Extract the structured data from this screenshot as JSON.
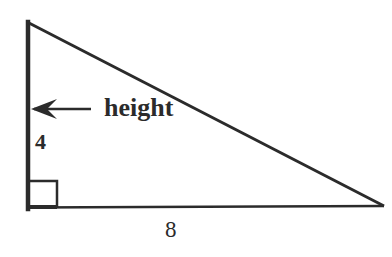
{
  "diagram": {
    "type": "right-triangle",
    "labels": {
      "height_label": "height",
      "height_value": "4",
      "base_value": "8"
    },
    "colors": {
      "stroke": "#2b2b2b",
      "background": "#ffffff"
    },
    "right_angle_marker": true,
    "arrow_points_to": "vertical-side"
  }
}
